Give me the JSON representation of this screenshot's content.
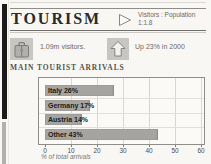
{
  "header": {
    "title": "TOURISM",
    "ratio_label": "Visitors : Population",
    "ratio_value": "1:1.8"
  },
  "stats": {
    "visitors": {
      "icon": "suitcase-icon",
      "text": "1.09m visitors."
    },
    "growth": {
      "icon": "up-arrow-icon",
      "text": "Up 23% in 2000"
    }
  },
  "section_heading": "MAIN TOURIST ARRIVALS",
  "chart_data": {
    "type": "bar",
    "orientation": "horizontal",
    "title": "MAIN TOURIST ARRIVALS",
    "categories": [
      "Italy",
      "Germany",
      "Austria",
      "Other"
    ],
    "values": [
      26,
      17,
      14,
      43
    ],
    "bar_labels": [
      "Italy 26%",
      "Germany 17%",
      "Austria 14%",
      "Other 43%"
    ],
    "xlabel": "% of total arrivals",
    "x_ticks": [
      0,
      10,
      20,
      30,
      40,
      50,
      60
    ],
    "xlim": [
      0,
      60
    ],
    "grid": true,
    "legend": "none",
    "bar_color": "#a6a4a1"
  },
  "colors": {
    "page_bg": "#f8f7f4",
    "bar": "#a6a4a1",
    "chart_border": "#8f8d8a",
    "spine_black": "#1a1a1a",
    "spine_gray": "#b3b1ae",
    "icon_box_bg": "#c7c6c3"
  }
}
